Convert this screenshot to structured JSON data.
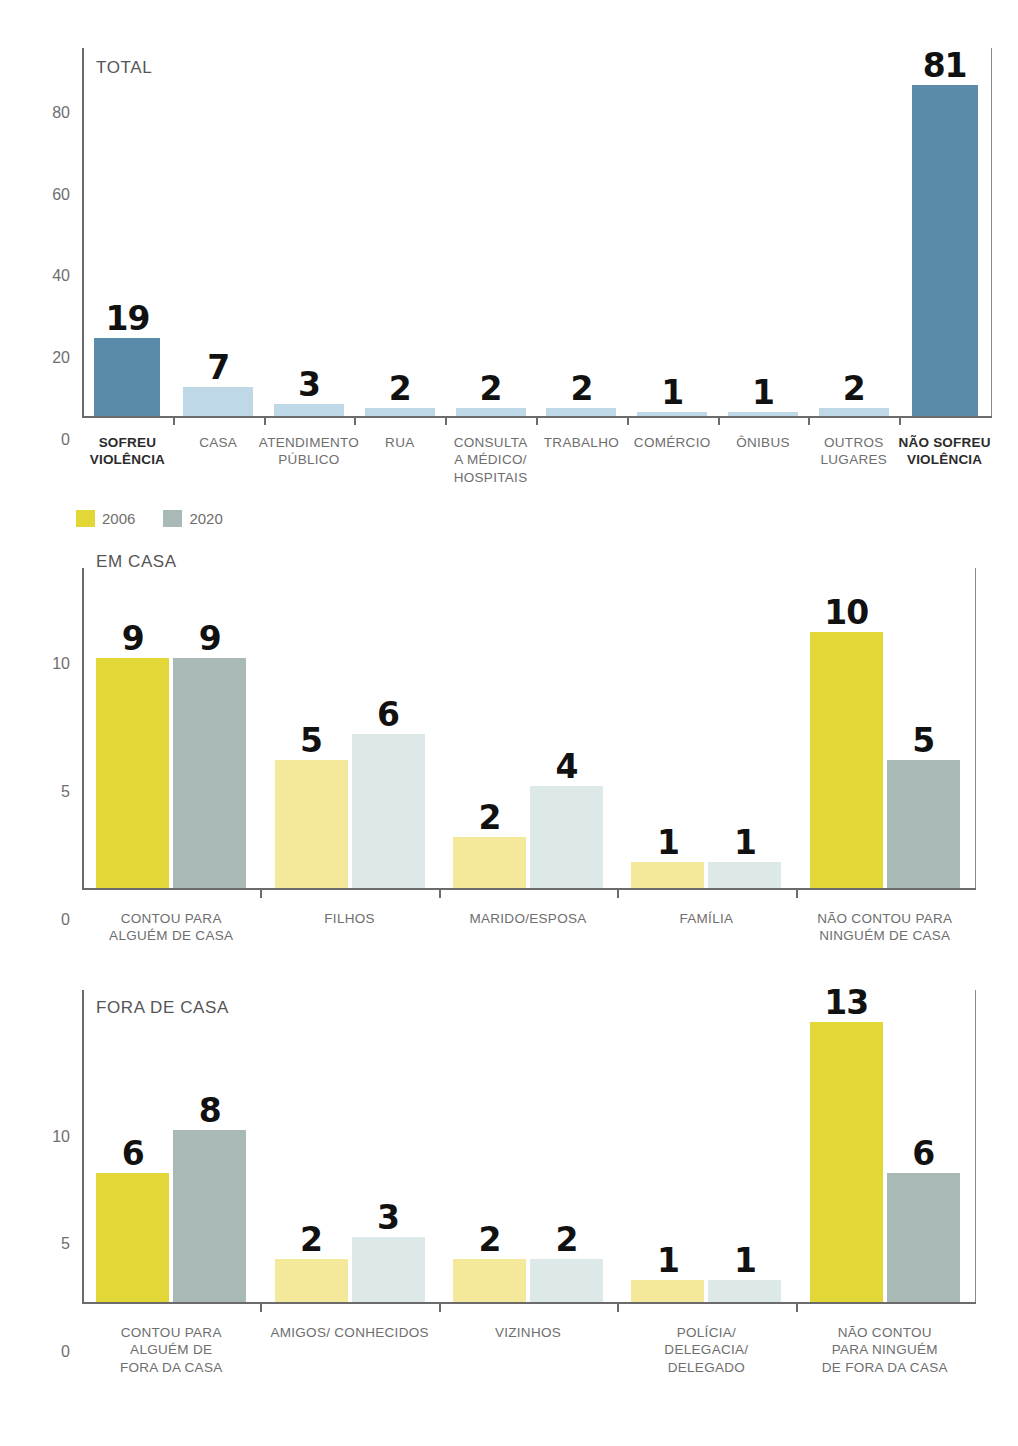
{
  "legend": {
    "items": [
      {
        "label": "2006",
        "color": "#e3d637"
      },
      {
        "label": "2020",
        "color": "#a9bab6"
      }
    ]
  },
  "colors": {
    "blue_dark": "#5b8bab",
    "blue_light": "#bfd8e8",
    "yellow_strong": "#e3d637",
    "yellow_pale": "#f4e99b",
    "green_strong": "#a9bab6",
    "green_pale": "#dce9e8",
    "axis": "#6b6b6b",
    "text": "#6e6e6e"
  },
  "chart_data": [
    {
      "type": "bar",
      "title": "TOTAL",
      "xlabel": "",
      "ylabel": "",
      "ylim": [
        0,
        90
      ],
      "yticks": [
        0,
        20,
        40,
        60,
        80
      ],
      "grid": false,
      "legend_position": "none",
      "categories": [
        "SOFREU VIOLÊNCIA",
        "CASA",
        "ATENDIMENTO PÚBLICO",
        "RUA",
        "CONSULTA A MÉDICO/ HOSPITAIS",
        "TRABALHO",
        "COMÉRCIO",
        "ÔNIBUS",
        "OUTROS LUGARES",
        "NÃO SOFREU VIOLÊNCIA"
      ],
      "category_lines": [
        [
          "SOFREU",
          "VIOLÊNCIA"
        ],
        [
          "CASA"
        ],
        [
          "ATENDIMENTO",
          "PÚBLICO"
        ],
        [
          "RUA"
        ],
        [
          "CONSULTA",
          "A MÉDICO/",
          "HOSPITAIS"
        ],
        [
          "TRABALHO"
        ],
        [
          "COMÉRCIO"
        ],
        [
          "ÔNIBUS"
        ],
        [
          "OUTROS",
          "LUGARES"
        ],
        [
          "NÃO SOFREU",
          "VIOLÊNCIA"
        ]
      ],
      "values": [
        19,
        7,
        3,
        2,
        2,
        2,
        1,
        1,
        2,
        81
      ],
      "bar_colors": [
        "#5b8bab",
        "#bfd8e8",
        "#bfd8e8",
        "#bfd8e8",
        "#bfd8e8",
        "#bfd8e8",
        "#bfd8e8",
        "#bfd8e8",
        "#bfd8e8",
        "#5b8bab"
      ],
      "emphasized": [
        true,
        false,
        false,
        false,
        false,
        false,
        false,
        false,
        false,
        true
      ]
    },
    {
      "type": "bar",
      "title": "EM CASA",
      "xlabel": "",
      "ylabel": "",
      "ylim": [
        0,
        12.5
      ],
      "yticks": [
        0,
        5,
        10
      ],
      "grid": false,
      "legend_position": "top-left",
      "categories": [
        "CONTOU PARA ALGUÉM DE CASA",
        "FILHOS",
        "MARIDO/ESPOSA",
        "FAMÍLIA",
        "NÃO CONTOU PARA NINGUÉM DE CASA"
      ],
      "category_lines": [
        [
          "CONTOU PARA",
          "ALGUÉM DE CASA"
        ],
        [
          "FILHOS"
        ],
        [
          "MARIDO/ESPOSA"
        ],
        [
          "FAMÍLIA"
        ],
        [
          "NÃO CONTOU PARA",
          "NINGUÉM DE CASA"
        ]
      ],
      "series": [
        {
          "name": "2006",
          "values": [
            9,
            5,
            2,
            1,
            10
          ]
        },
        {
          "name": "2020",
          "values": [
            9,
            6,
            4,
            1,
            5
          ]
        }
      ],
      "emphasized": [
        true,
        false,
        false,
        false,
        true
      ]
    },
    {
      "type": "bar",
      "title": "FORA DE CASA",
      "xlabel": "",
      "ylabel": "",
      "ylim": [
        0,
        14.5
      ],
      "yticks": [
        0,
        5,
        10
      ],
      "grid": false,
      "legend_position": "none",
      "categories": [
        "CONTOU PARA ALGUÉM DE FORA DA CASA",
        "AMIGOS/ CONHECIDOS",
        "VIZINHOS",
        "POLÍCIA/ DELEGACIA/ DELEGADO",
        "NÃO CONTOU PARA NINGUÉM DE FORA DA CASA"
      ],
      "category_lines": [
        [
          "CONTOU PARA",
          "ALGUÉM DE",
          "FORA DA CASA"
        ],
        [
          "AMIGOS/ CONHECIDOS"
        ],
        [
          "VIZINHOS"
        ],
        [
          "POLÍCIA/",
          "DELEGACIA/",
          "DELEGADO"
        ],
        [
          "NÃO CONTOU",
          "PARA NINGUÉM",
          "DE FORA DA CASA"
        ]
      ],
      "series": [
        {
          "name": "2006",
          "values": [
            6,
            2,
            2,
            1,
            13
          ]
        },
        {
          "name": "2020",
          "values": [
            8,
            3,
            2,
            1,
            6
          ]
        }
      ],
      "emphasized": [
        true,
        false,
        false,
        false,
        true
      ]
    }
  ]
}
